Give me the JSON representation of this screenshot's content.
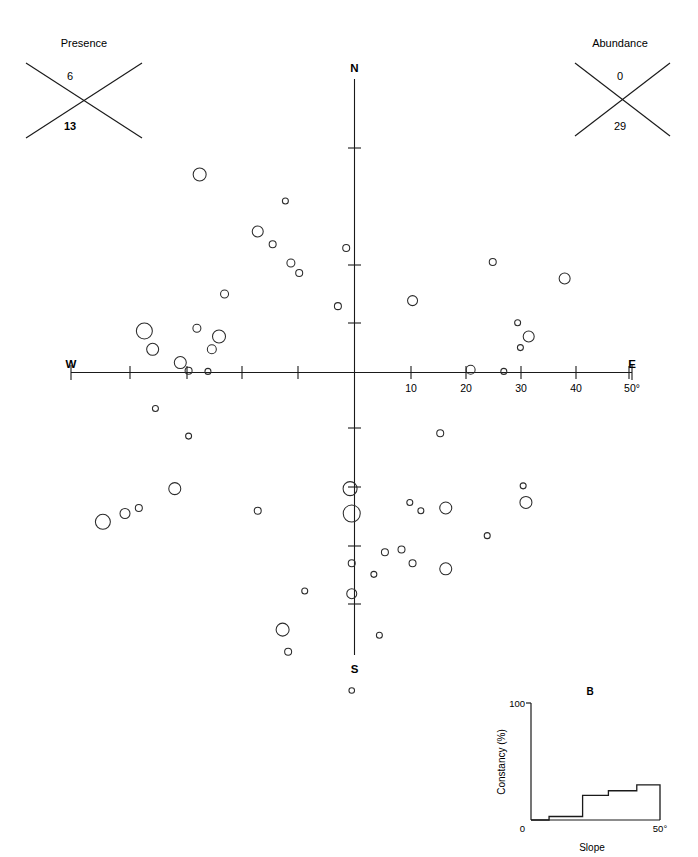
{
  "figure": {
    "background_color": "#ffffff",
    "line_color": "#1a1a1a",
    "bubble_stroke_color": "#2b2b2b"
  },
  "legend_left": {
    "name": "presence-legend",
    "title": "Presence",
    "top_value": "6",
    "bottom_value": "13",
    "bottom_bold": true
  },
  "legend_right": {
    "name": "abundance-legend",
    "title": "Abundance",
    "top_value": "0",
    "bottom_value": "29",
    "bottom_bold": false
  },
  "compass": {
    "north_label": "N",
    "south_label": "S",
    "east_label": "E",
    "west_label": "W",
    "east_tick_labels": [
      "10",
      "20",
      "30",
      "40",
      "50°"
    ],
    "east_tick_values": [
      10,
      20,
      30,
      40,
      50
    ],
    "west_tick_values": [
      10,
      20,
      30,
      40
    ],
    "west_tick_labels": [
      "",
      "",
      "",
      ""
    ],
    "north_tick_values": [
      10,
      20,
      30
    ],
    "south_tick_values": [
      10,
      20,
      30,
      40
    ],
    "axis_unit": "degrees",
    "axis_max": 50
  },
  "chart_data": {
    "type": "scatter",
    "xlabel": "Slope (W – E, degrees)",
    "ylabel": "Slope (S – N, degrees)",
    "xlim": [
      -50,
      50
    ],
    "ylim": [
      -50,
      50
    ],
    "grid": false,
    "legend": "none",
    "encoding": {
      "x": "east-west slope component (degrees)",
      "y": "north-south slope component (degrees)",
      "size": "abundance / presence class (circle radius in px)"
    },
    "points": [
      {
        "x": -28.0,
        "y": 35.8,
        "r": 6.5
      },
      {
        "x": -12.5,
        "y": 31.0,
        "r": 3.0
      },
      {
        "x": -17.5,
        "y": 25.5,
        "r": 5.5
      },
      {
        "x": -14.8,
        "y": 23.2,
        "r": 3.5
      },
      {
        "x": -11.5,
        "y": 19.8,
        "r": 4.0
      },
      {
        "x": -10.0,
        "y": 18.0,
        "r": 3.5
      },
      {
        "x": -1.5,
        "y": 22.5,
        "r": 3.5
      },
      {
        "x": -23.5,
        "y": 14.2,
        "r": 4.0
      },
      {
        "x": -3.0,
        "y": 12.0,
        "r": 3.5
      },
      {
        "x": 10.5,
        "y": 13.0,
        "r": 5.0
      },
      {
        "x": 25.0,
        "y": 20.0,
        "r": 3.5
      },
      {
        "x": 38.0,
        "y": 17.0,
        "r": 5.5
      },
      {
        "x": -38.0,
        "y": 7.5,
        "r": 8.0
      },
      {
        "x": -36.5,
        "y": 4.2,
        "r": 6.0
      },
      {
        "x": -28.5,
        "y": 8.0,
        "r": 4.0
      },
      {
        "x": -24.5,
        "y": 6.5,
        "r": 6.5
      },
      {
        "x": -25.8,
        "y": 4.2,
        "r": 4.5
      },
      {
        "x": -31.5,
        "y": 1.8,
        "r": 6.0
      },
      {
        "x": -30.0,
        "y": 0.3,
        "r": 3.5
      },
      {
        "x": -26.5,
        "y": 0.2,
        "r": 3.0
      },
      {
        "x": 21.0,
        "y": 0.5,
        "r": 4.5
      },
      {
        "x": 27.0,
        "y": 0.2,
        "r": 3.0
      },
      {
        "x": 29.5,
        "y": 9.0,
        "r": 3.0
      },
      {
        "x": 31.5,
        "y": 6.5,
        "r": 5.5
      },
      {
        "x": 30.0,
        "y": 4.5,
        "r": 3.0
      },
      {
        "x": -36.0,
        "y": -6.5,
        "r": 3.0
      },
      {
        "x": -30.0,
        "y": -11.5,
        "r": 3.0
      },
      {
        "x": 15.5,
        "y": -11.0,
        "r": 3.5
      },
      {
        "x": -32.5,
        "y": -21.0,
        "r": 6.0
      },
      {
        "x": -39.0,
        "y": -24.5,
        "r": 3.5
      },
      {
        "x": -41.5,
        "y": -25.5,
        "r": 5.0
      },
      {
        "x": -45.5,
        "y": -27.0,
        "r": 7.5
      },
      {
        "x": -17.5,
        "y": -25.0,
        "r": 3.5
      },
      {
        "x": -0.8,
        "y": -21.0,
        "r": 7.0
      },
      {
        "x": -0.5,
        "y": -25.5,
        "r": 8.5
      },
      {
        "x": 10.0,
        "y": -23.5,
        "r": 3.0
      },
      {
        "x": 12.0,
        "y": -25.0,
        "r": 3.0
      },
      {
        "x": 16.5,
        "y": -24.5,
        "r": 6.0
      },
      {
        "x": 30.5,
        "y": -20.5,
        "r": 3.0
      },
      {
        "x": 31.0,
        "y": -23.5,
        "r": 6.0
      },
      {
        "x": 24.0,
        "y": -29.5,
        "r": 3.0
      },
      {
        "x": 5.5,
        "y": -32.5,
        "r": 3.5
      },
      {
        "x": 8.5,
        "y": -32.0,
        "r": 3.5
      },
      {
        "x": 10.5,
        "y": -34.5,
        "r": 3.5
      },
      {
        "x": -0.5,
        "y": -34.5,
        "r": 3.5
      },
      {
        "x": 3.5,
        "y": -36.5,
        "r": 3.0
      },
      {
        "x": 16.5,
        "y": -35.5,
        "r": 6.0
      },
      {
        "x": -9.0,
        "y": -39.5,
        "r": 3.0
      },
      {
        "x": -0.5,
        "y": -40.0,
        "r": 5.0
      },
      {
        "x": -13.0,
        "y": -46.5,
        "r": 6.5
      },
      {
        "x": -12.0,
        "y": -50.5,
        "r": 3.5
      },
      {
        "x": 4.5,
        "y": -47.5,
        "r": 3.0
      },
      {
        "x": -0.5,
        "y": -57.5,
        "r": 2.8
      }
    ]
  },
  "inset": {
    "name": "constancy-slope-inset",
    "panel_label": "B",
    "ylabel": "Constancy (%)",
    "xlabel": "Slope",
    "y_max_label": "100",
    "y_min_label": "0",
    "x_min_label": "0",
    "x_max_label": "50°",
    "chart_data": {
      "type": "bar",
      "title": "B",
      "xlabel": "Slope",
      "ylabel": "Constancy (%)",
      "xlim": [
        0,
        50
      ],
      "ylim": [
        0,
        100
      ],
      "grid": false,
      "legend": "none",
      "categories": [
        "0-7",
        "7-20",
        "20-30",
        "30-41",
        "41-50"
      ],
      "bin_edges": [
        0,
        7,
        20,
        30,
        41,
        50
      ],
      "values": [
        0,
        3,
        21,
        25,
        30
      ]
    }
  }
}
